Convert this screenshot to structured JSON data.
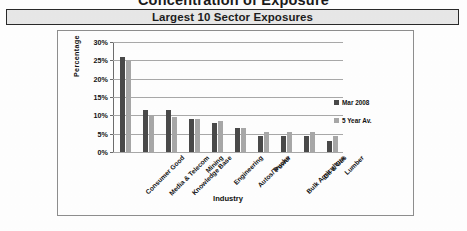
{
  "document": {
    "title": "Concentration of Exposure",
    "subtitle": "Largest 10 Sector Exposures"
  },
  "colors": {
    "series_current": "#4a4a4a",
    "series_average": "#a8a8a8",
    "gridline": "#a9a9a9",
    "banner_background": "#e8e8e8",
    "frame_border": "#8e8e8e"
  },
  "chart_data": {
    "type": "bar",
    "title": "Largest 10 Sector Exposures",
    "xlabel": "Industry",
    "ylabel": "Percentage",
    "ylim": [
      0,
      30
    ],
    "ytick_labels": [
      "0%",
      "5%",
      "10%",
      "15%",
      "20%",
      "25%",
      "30%"
    ],
    "yticks": [
      0,
      5,
      10,
      15,
      20,
      25,
      30
    ],
    "grid": true,
    "legend_position": "right",
    "categories": [
      "Consumer Good",
      "Media & Telecom",
      "Knowledge Base",
      "Mining",
      "Engineering",
      "Autos/Trucks",
      "Power",
      "Bulk Agriculture",
      "Oil & Gas",
      "Lumber"
    ],
    "series": [
      {
        "name": "Mar 2008",
        "values": [
          26.0,
          11.5,
          11.5,
          9.0,
          8.0,
          6.5,
          4.5,
          4.5,
          4.5,
          3.0
        ]
      },
      {
        "name": "5 Year Av.",
        "values": [
          25.0,
          10.0,
          9.5,
          9.0,
          8.5,
          6.5,
          5.5,
          5.5,
          5.5,
          4.5
        ]
      }
    ]
  }
}
